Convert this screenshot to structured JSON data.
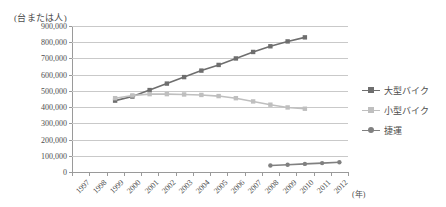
{
  "chart_data": {
    "type": "line",
    "title": "",
    "xlabel": "(年)",
    "ylabel": "(台または人)",
    "ylim": [
      0,
      900000
    ],
    "ytick_labels": [
      "900,000",
      "800,000",
      "700,000",
      "600,000",
      "500,000",
      "400,000",
      "300,000",
      "200,000",
      "100,000",
      "0"
    ],
    "ytick_values": [
      900000,
      800000,
      700000,
      600000,
      500000,
      400000,
      300000,
      200000,
      100000,
      0
    ],
    "grid": true,
    "legend_position": "right",
    "categories": [
      "1997",
      "1998",
      "1999",
      "2000",
      "2001",
      "2002",
      "2003",
      "2004",
      "2005",
      "2006",
      "2007",
      "2008",
      "2009",
      "2010",
      "2011",
      "2012"
    ],
    "x": [
      1997,
      1998,
      1999,
      2000,
      2001,
      2002,
      2003,
      2004,
      2005,
      2006,
      2007,
      2008,
      2009,
      2010,
      2011,
      2012
    ],
    "series": [
      {
        "name": "大型バイク",
        "color": "#6e6e6e",
        "marker": "square",
        "x": [
          1999,
          2000,
          2001,
          2002,
          2003,
          2004,
          2005,
          2006,
          2007,
          2008,
          2009,
          2010
        ],
        "values": [
          440000,
          465000,
          505000,
          545000,
          585000,
          625000,
          660000,
          700000,
          740000,
          775000,
          805000,
          830000
        ]
      },
      {
        "name": "小型バイク",
        "color": "#bfbfbf",
        "marker": "square",
        "x": [
          1999,
          2000,
          2001,
          2002,
          2003,
          2004,
          2005,
          2006,
          2007,
          2008,
          2009,
          2010
        ],
        "values": [
          455000,
          472000,
          480000,
          480000,
          478000,
          475000,
          468000,
          455000,
          435000,
          415000,
          398000,
          390000
        ]
      },
      {
        "name": "捷運",
        "color": "#808080",
        "marker": "round",
        "x": [
          2008,
          2009,
          2010,
          2011,
          2012
        ],
        "values": [
          40000,
          45000,
          50000,
          55000,
          60000
        ]
      }
    ]
  },
  "legend": {
    "items": [
      {
        "label": "大型バイク"
      },
      {
        "label": "小型バイク"
      },
      {
        "label": "捷運"
      }
    ]
  }
}
